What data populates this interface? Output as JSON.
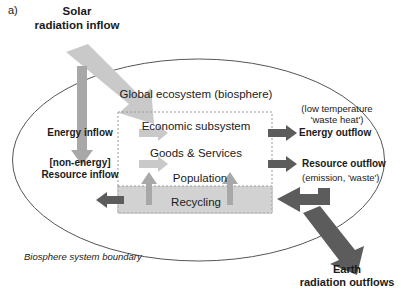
{
  "figure": {
    "panel_label": "a)",
    "caption_color": "#1a1a1a"
  },
  "colors": {
    "light_arrow": "#c9c9c9",
    "mid_arrow": "#a8a8a8",
    "dark_arrow": "#5c5c5c",
    "recycling_fill": "#d2d2d2",
    "dashed_border": "#9a9a9a",
    "ellipse_stroke": "#555555",
    "text": "#1a1a1a"
  },
  "labels": {
    "solar_radiation_inflow": "Solar\nradiation inflow",
    "solar_line1": "Solar",
    "solar_line2": "radiation inflow",
    "global_ecosystem": "Global ecosystem (biosphere)",
    "economic_subsystem": "Economic subsystem",
    "goods_and_services": "Goods & Services",
    "population": "Population",
    "recycling": "Recycling",
    "energy_inflow": "Energy inflow",
    "resource_inflow_line1": "[non-energy]",
    "resource_inflow_line2": "Resource inflow",
    "waste_heat_line1": "(low temperature",
    "waste_heat_line2": "'waste heat')",
    "energy_outflow": "Energy outflow",
    "resource_outflow": "Resource outflow",
    "emission_waste": "(emission, 'waste')",
    "earth_line1": "Earth",
    "earth_line2": "radiation outflows",
    "biosphere_boundary": "Biosphere system boundary"
  },
  "geometry": {
    "ellipse": {
      "cx": 198.5,
      "cy": 160,
      "rx": 186,
      "ry": 101
    },
    "dashed_box": {
      "x": 118,
      "y": 112,
      "width": 154,
      "height": 101
    },
    "recycling_band": {
      "x": 118,
      "y": 186,
      "width": 154,
      "height": 27
    }
  },
  "arrows": [
    {
      "name": "solar-radiation-arrow",
      "direction": "diagonal-down-right",
      "shade": "light"
    },
    {
      "name": "solar-vertical-arrow",
      "direction": "down",
      "shade": "mid"
    },
    {
      "name": "energy-inflow-arrow",
      "direction": "right",
      "shade": "light"
    },
    {
      "name": "resource-inflow-arrow",
      "direction": "right",
      "shade": "light"
    },
    {
      "name": "energy-outflow-arrow",
      "direction": "right",
      "shade": "dark"
    },
    {
      "name": "resource-outflow-arrow",
      "direction": "right",
      "shade": "dark"
    },
    {
      "name": "recycling-left-arrow",
      "direction": "left",
      "shade": "dark"
    },
    {
      "name": "recycling-return-arrow",
      "direction": "left-elbow",
      "shade": "dark"
    },
    {
      "name": "recycling-up-arrow-left",
      "direction": "up",
      "shade": "mid"
    },
    {
      "name": "recycling-up-arrow-right",
      "direction": "up",
      "shade": "mid"
    },
    {
      "name": "earth-radiation-arrow",
      "direction": "diagonal-down-right",
      "shade": "dark"
    }
  ]
}
